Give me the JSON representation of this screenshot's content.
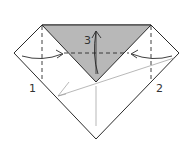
{
  "diagram": {
    "type": "origami-fold-step",
    "colors": {
      "paper": "#ffffff",
      "shaded_flap": "#b8b8b8",
      "line": "#2a2a2a",
      "thin_line": "#9a9a9a"
    },
    "labels": [
      {
        "id": "step-1",
        "text": "1"
      },
      {
        "id": "step-2",
        "text": "2"
      },
      {
        "id": "step-3",
        "text": "3"
      }
    ]
  }
}
